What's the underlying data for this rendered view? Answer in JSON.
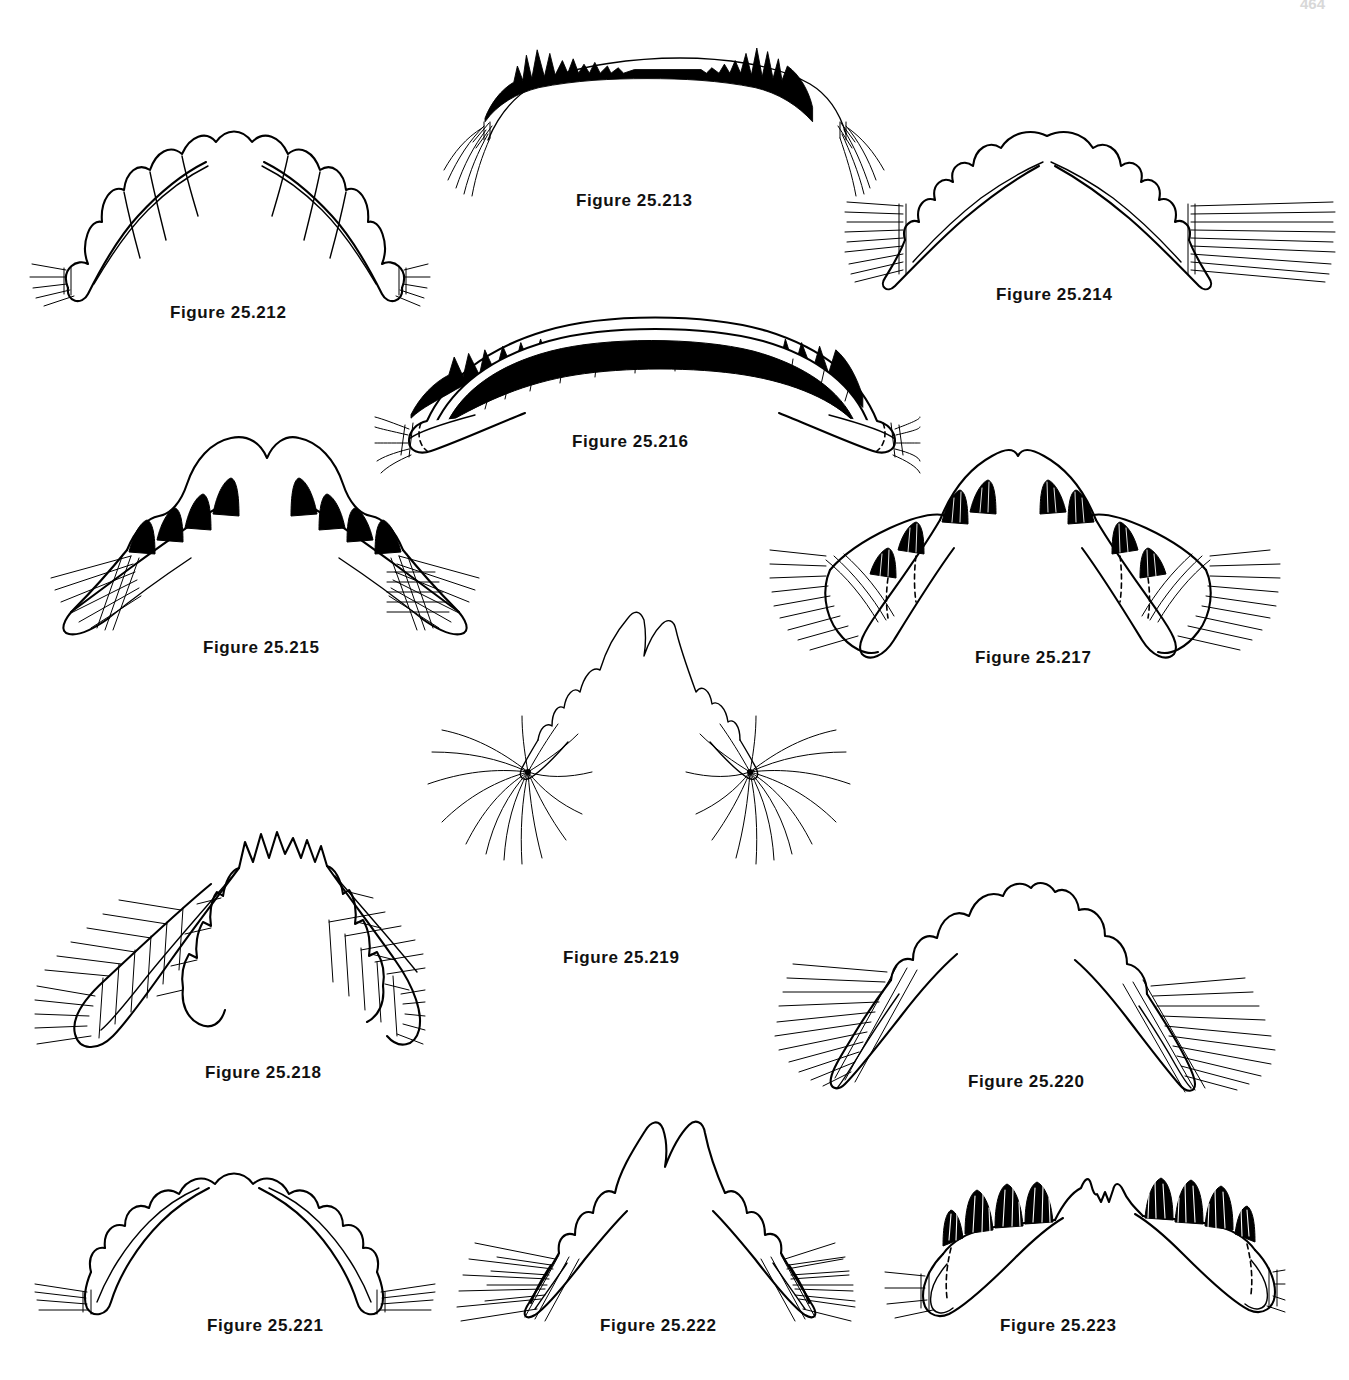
{
  "plate": {
    "title": "Mandible and labrum figure plate",
    "page_number": "464",
    "background_color": "#ffffff",
    "ink_color": "#000000",
    "caption_prefix": "Figure",
    "figure_count": 12
  },
  "figures": [
    {
      "id": "25.212",
      "caption": "Figure 25.212",
      "subject": "larval labrum, symmetrical lobed margin with marginal setae tufts",
      "style": "outline",
      "caption_x": 170,
      "caption_y": 303,
      "art_x": 30,
      "art_y": 90,
      "art_w": 390,
      "art_h": 215
    },
    {
      "id": "25.213",
      "caption": "Figure 25.213",
      "subject": "broad arched labrum with dense black serrate crest and lateral seta tufts",
      "style": "filled-black",
      "caption_x": 576,
      "caption_y": 191,
      "art_x": 440,
      "art_y": 32,
      "art_w": 390,
      "art_h": 160
    },
    {
      "id": "25.214",
      "caption": "Figure 25.214",
      "subject": "arched mandible pair with scalloped inner teeth and banded lateral setae",
      "style": "outline",
      "caption_x": 996,
      "caption_y": 285,
      "art_x": 845,
      "art_y": 125,
      "art_w": 480,
      "art_h": 170
    },
    {
      "id": "25.215",
      "caption": "Figure 25.215",
      "subject": "V-shaped mandibles with tall hatched teeth and basal seta fringe",
      "style": "hatched",
      "caption_x": 203,
      "caption_y": 638,
      "art_x": 35,
      "art_y": 425,
      "art_w": 480,
      "art_h": 215
    },
    {
      "id": "25.216",
      "caption": "Figure 25.216",
      "subject": "wide arched labrum, solid black brush crest with large black teeth",
      "style": "filled-black",
      "caption_x": 572,
      "caption_y": 432,
      "art_x": 375,
      "art_y": 305,
      "art_w": 540,
      "art_h": 150
    },
    {
      "id": "25.217",
      "caption": "Figure 25.217",
      "subject": "mandible pair with shaded teeth, dashed internal lines and seta bands",
      "style": "hatched",
      "caption_x": 975,
      "caption_y": 648,
      "art_x": 770,
      "art_y": 430,
      "art_w": 500,
      "art_h": 230
    },
    {
      "id": "25.218",
      "caption": "Figure 25.218",
      "subject": "narrow paddle-shaped mandibles with crenulate margin and long setae",
      "style": "outline",
      "caption_x": 205,
      "caption_y": 1063,
      "art_x": 35,
      "art_y": 810,
      "art_w": 380,
      "art_h": 240
    },
    {
      "id": "25.219",
      "caption": "Figure 25.219",
      "subject": "bifid-apex labrum with two radiating fans of long fine setae",
      "style": "outline",
      "caption_x": 563,
      "caption_y": 958,
      "art_x": 420,
      "art_y": 605,
      "art_w": 420,
      "art_h": 330
    },
    {
      "id": "25.220",
      "caption": "Figure 25.220",
      "subject": "steeply V-shaped mandibles with rounded lobes and dense lateral setae",
      "style": "outline",
      "caption_x": 968,
      "caption_y": 1072,
      "art_x": 775,
      "art_y": 870,
      "art_w": 500,
      "art_h": 215
    },
    {
      "id": "25.221",
      "caption": "Figure 25.221",
      "subject": "shallow arched mandibles, smooth rounded teeth, few apical setae",
      "style": "outline",
      "caption_x": 207,
      "caption_y": 1316,
      "art_x": 35,
      "art_y": 1145,
      "art_w": 400,
      "art_h": 170
    },
    {
      "id": "25.222",
      "caption": "Figure 25.222",
      "subject": "peaked mandibles with stepped teeth and heavy basal seta brushes",
      "style": "outline",
      "caption_x": 600,
      "caption_y": 1316,
      "art_x": 455,
      "art_y": 1095,
      "art_w": 400,
      "art_h": 220
    },
    {
      "id": "25.223",
      "caption": "Figure 25.223",
      "subject": "broad mandibles with large hatched blunt teeth and dashed inner margin",
      "style": "hatched",
      "caption_x": 1000,
      "caption_y": 1316,
      "art_x": 885,
      "art_y": 1150,
      "art_w": 400,
      "art_h": 170
    }
  ]
}
